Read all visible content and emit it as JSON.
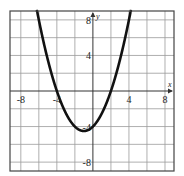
{
  "chart_data": {
    "type": "line",
    "title": "",
    "xlabel": "x",
    "ylabel": "y",
    "xlim": [
      -9.2,
      9.0
    ],
    "ylim": [
      -9.0,
      9.0
    ],
    "grid": true,
    "grid_step": 2,
    "x_ticks": [
      -8,
      -4,
      4,
      8
    ],
    "y_ticks": [
      8,
      4,
      -4,
      -8
    ],
    "x_tick_labels": [
      "-8",
      "-4",
      "4",
      "8"
    ],
    "y_tick_labels": [
      "8",
      "4",
      "-4",
      "-8"
    ],
    "series": [
      {
        "name": "parabola",
        "equation": "y = 0.5x^2 + x - 4",
        "coefficients": {
          "a": 0.5,
          "b": 1,
          "c": -4
        },
        "vertex": [
          -1,
          -4.5
        ],
        "roots": [
          -4,
          2
        ],
        "y_intercept": -4,
        "color": "#111111"
      }
    ]
  }
}
